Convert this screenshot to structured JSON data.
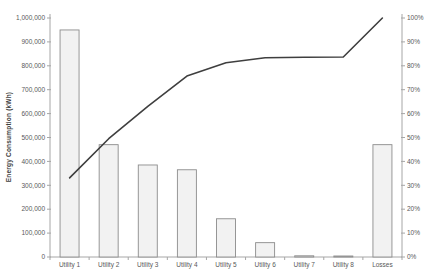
{
  "window": {
    "background": "#ffffff"
  },
  "chart_data": {
    "type": "bar",
    "subtype": "pareto-combo-bar-line",
    "title": "",
    "xlabel": "",
    "ylabel": "Energy Consumption (kWh)",
    "categories": [
      "Utility 1",
      "Utility 2",
      "Utility 3",
      "Utility 4",
      "Utility 5",
      "Utility 6",
      "Utility 7",
      "Utility 8",
      "Losses"
    ],
    "series": [
      {
        "name": "Energy Consumption (kWh)",
        "type": "bar",
        "axis": "left",
        "values": [
          950000,
          470000,
          385000,
          365000,
          160000,
          60000,
          5000,
          3000,
          470000
        ]
      },
      {
        "name": "Cumulative percentage",
        "type": "line",
        "axis": "right",
        "values": [
          33.1,
          49.5,
          63.0,
          75.7,
          81.3,
          83.4,
          83.6,
          83.7,
          100
        ]
      }
    ],
    "left_axis": {
      "min": 0,
      "max": 1000000,
      "step": 100000,
      "tick_labels": [
        "0",
        "100,000",
        "200,000",
        "300,000",
        "400,000",
        "500,000",
        "600,000",
        "700,000",
        "800,000",
        "900,000",
        "1,000,000"
      ]
    },
    "right_axis": {
      "min": 0,
      "max": 100,
      "step": 10,
      "tick_labels": [
        "0%",
        "10%",
        "20%",
        "30%",
        "40%",
        "50%",
        "60%",
        "70%",
        "80%",
        "90%",
        "100%"
      ]
    },
    "grid": false,
    "legend": "none",
    "colors": {
      "bar_fill": "#f2f2f2",
      "bar_stroke": "#8c8c8c",
      "line": "#3f3f3f",
      "axis": "#a6a6a6",
      "tick_text": "#595959"
    }
  }
}
